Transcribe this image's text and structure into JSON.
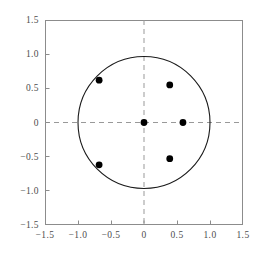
{
  "chart_data": {
    "type": "scatter",
    "title": "",
    "subtitle": "",
    "xlabel": "",
    "ylabel": "",
    "xlim": [
      -1.5,
      1.5
    ],
    "ylim": [
      -1.5,
      1.5
    ],
    "grid": false,
    "legend": null,
    "xticks": [
      -1.5,
      -1.0,
      -0.5,
      0,
      0.5,
      1.0,
      1.5
    ],
    "yticks": [
      -1.5,
      -1.0,
      -0.5,
      0,
      0.5,
      1.0,
      1.5
    ],
    "xtick_labels": [
      "−1.5",
      "−1.0",
      "−0.5",
      "0",
      "0.5",
      "1.0",
      "1.5"
    ],
    "ytick_labels": [
      "−1.5",
      "−1.0",
      "−0.5",
      "0",
      "0.5",
      "1.0",
      "1.5"
    ],
    "series": [
      {
        "name": "points",
        "marker": "circle",
        "marker_color": "#000000",
        "marker_size": 3.4,
        "points": [
          {
            "x": 0.0,
            "y": 0.0
          },
          {
            "x": 0.59,
            "y": 0.0
          },
          {
            "x": 0.39,
            "y": 0.55
          },
          {
            "x": -0.68,
            "y": 0.62
          },
          {
            "x": -0.68,
            "y": -0.62
          },
          {
            "x": 0.39,
            "y": -0.53
          }
        ]
      }
    ],
    "annotations": [
      {
        "kind": "circle",
        "name": "unit-circle",
        "cx": 0.0,
        "cy": 0.0,
        "r": 1.0,
        "stroke": "#1a1a1a",
        "fill": "none",
        "linewidth": 1.0
      },
      {
        "kind": "hline",
        "name": "x-axis-guide",
        "y": 0.0,
        "stroke": "#999999",
        "dash": "5,4",
        "linewidth": 1.0
      },
      {
        "kind": "vline",
        "name": "y-axis-guide",
        "x": 0.0,
        "stroke": "#999999",
        "dash": "5,4",
        "linewidth": 1.0
      }
    ],
    "frame": {
      "stroke": "#8c8c8c",
      "fill": "#ffffff",
      "linewidth": 1.0
    },
    "background": "#ffffff"
  }
}
